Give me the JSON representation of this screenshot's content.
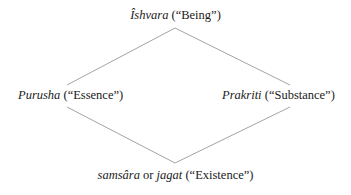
{
  "diagram": {
    "type": "rhombus-concept-diagram",
    "background_color": "#ffffff",
    "line_color": "#999999",
    "text_color": "#1a1a1a",
    "nodes": {
      "top": {
        "term": "Îshvara",
        "gloss": "(“Being”)"
      },
      "left": {
        "term": "Purusha",
        "gloss": "(“Essence”)"
      },
      "right": {
        "term": "Prakriti",
        "gloss": "(“Substance”)"
      },
      "bottom": {
        "term_one": "samsâra",
        "conjunction": "or",
        "term_two": "jagat",
        "gloss": "(“Existence”)"
      }
    }
  }
}
